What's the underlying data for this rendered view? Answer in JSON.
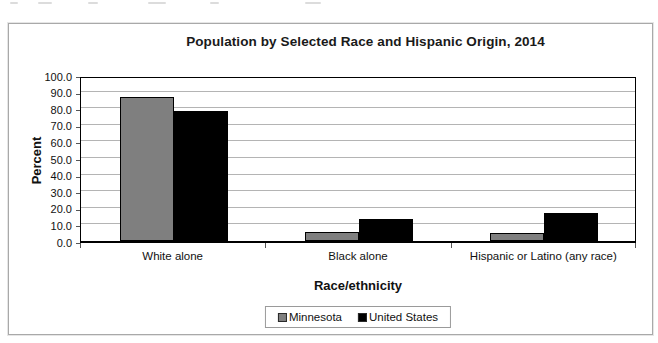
{
  "chart_data": {
    "type": "bar",
    "title": "Population by Selected Race and Hispanic Origin, 2014",
    "xlabel": "Race/ethnicity",
    "ylabel": "Percent",
    "categories": [
      "White alone",
      "Black alone",
      "Hispanic or Latino (any race)"
    ],
    "series": [
      {
        "name": "Minnesota",
        "color": "#7f7f7f",
        "values": [
          87,
          5.5,
          5
        ]
      },
      {
        "name": "United States",
        "color": "#000000",
        "values": [
          78.5,
          13,
          17
        ]
      }
    ],
    "ylim": [
      0,
      100
    ],
    "ytick_interval": 10,
    "ytick_labels": [
      "0.0",
      "10.0",
      "20.0",
      "30.0",
      "40.0",
      "50.0",
      "60.0",
      "70.0",
      "80.0",
      "90.0",
      "100.0"
    ],
    "grid": true,
    "gridline_color": "#b4b4b4",
    "legend_position": "bottom"
  }
}
